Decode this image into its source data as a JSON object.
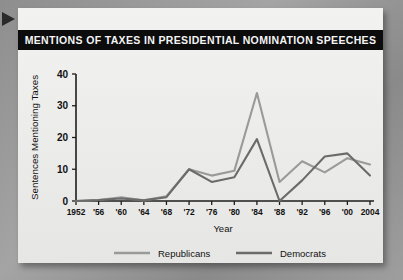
{
  "card": {
    "title": "MENTIONS OF TAXES IN PRESIDENTIAL NOMINATION SPEECHES",
    "pointer_icon": "triangle-pointer-icon"
  },
  "colors": {
    "republican": "#9a9a9a",
    "democrat": "#6b6b6b",
    "title_bar": "#0c0c0c",
    "title_text": "#f4f4f4",
    "axis": "#1d1d1d",
    "card_background": "#efefed",
    "page_background": "#9a9a9a"
  },
  "chart_data": {
    "type": "line",
    "title": "MENTIONS OF TAXES IN PRESIDENTIAL NOMINATION SPEECHES",
    "xlabel": "Year",
    "ylabel": "Sentences Mentioning Taxes",
    "x": [
      1952,
      1956,
      1960,
      1964,
      1968,
      1972,
      1976,
      1980,
      1984,
      1988,
      1992,
      1996,
      2000,
      2004
    ],
    "tick_labels": [
      "1952",
      "'56",
      "'60",
      "'64",
      "'68",
      "'72",
      "'76",
      "'80",
      "'84",
      "'88",
      "'92",
      "'96",
      "'00",
      "2004"
    ],
    "ylim": [
      0,
      40
    ],
    "yticks": [
      0,
      10,
      20,
      30,
      40
    ],
    "ytick_labels": [
      "0",
      "10",
      "20",
      "30",
      "40"
    ],
    "grid": false,
    "legend_position": "bottom",
    "series": [
      {
        "name": "Republicans",
        "color": "#9a9a9a",
        "values": [
          0,
          0.3,
          1.2,
          0.2,
          1.5,
          10,
          8,
          9.5,
          34,
          6,
          12.5,
          9,
          13.5,
          11.5
        ]
      },
      {
        "name": "Democrats",
        "color": "#6b6b6b",
        "values": [
          0,
          0.3,
          0.8,
          0.2,
          1.2,
          10,
          6,
          7.5,
          19.5,
          0,
          6.5,
          14,
          15,
          8
        ]
      }
    ]
  },
  "legend": {
    "items": [
      {
        "label": "Republicans",
        "color": "#9a9a9a"
      },
      {
        "label": "Democrats",
        "color": "#6b6b6b"
      }
    ]
  }
}
